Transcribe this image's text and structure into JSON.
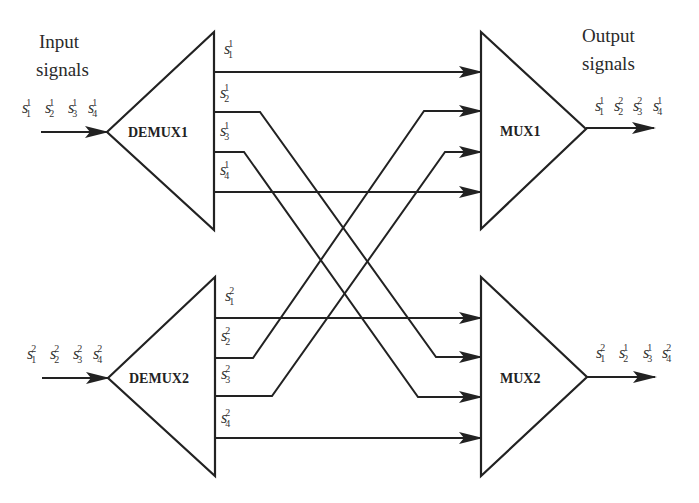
{
  "diagram": {
    "type": "WDM demultiplexer/multiplexer cross-connect",
    "input_title": [
      "Input",
      "signals"
    ],
    "output_title": [
      "Output",
      "signals"
    ],
    "blocks": {
      "demux1": "DEMUX1",
      "demux2": "DEMUX2",
      "mux1": "MUX1",
      "mux2": "MUX2"
    },
    "inputs": {
      "demux1": [
        {
          "base": "s",
          "sub": "1",
          "sup": "1"
        },
        {
          "base": "s",
          "sub": "2",
          "sup": "1"
        },
        {
          "base": "s",
          "sub": "3",
          "sup": "1"
        },
        {
          "base": "s",
          "sub": "4",
          "sup": "1"
        }
      ],
      "demux2": [
        {
          "base": "s",
          "sub": "1",
          "sup": "2"
        },
        {
          "base": "s",
          "sub": "2",
          "sup": "2"
        },
        {
          "base": "s",
          "sub": "3",
          "sup": "2"
        },
        {
          "base": "s",
          "sub": "4",
          "sup": "2"
        }
      ]
    },
    "demux1_ports": [
      {
        "base": "s",
        "sub": "1",
        "sup": "1"
      },
      {
        "base": "s",
        "sub": "2",
        "sup": "1"
      },
      {
        "base": "s",
        "sub": "3",
        "sup": "1"
      },
      {
        "base": "s",
        "sub": "4",
        "sup": "1"
      }
    ],
    "demux2_ports": [
      {
        "base": "s",
        "sub": "1",
        "sup": "2"
      },
      {
        "base": "s",
        "sub": "2",
        "sup": "2"
      },
      {
        "base": "s",
        "sub": "3",
        "sup": "2"
      },
      {
        "base": "s",
        "sub": "4",
        "sup": "2"
      }
    ],
    "outputs": {
      "mux1": [
        {
          "base": "s",
          "sub": "1",
          "sup": "1"
        },
        {
          "base": "s",
          "sub": "2",
          "sup": "2"
        },
        {
          "base": "s",
          "sub": "3",
          "sup": "2"
        },
        {
          "base": "s",
          "sub": "4",
          "sup": "1"
        }
      ],
      "mux2": [
        {
          "base": "s",
          "sub": "1",
          "sup": "2"
        },
        {
          "base": "s",
          "sub": "2",
          "sup": "1"
        },
        {
          "base": "s",
          "sub": "3",
          "sup": "1"
        },
        {
          "base": "s",
          "sub": "4",
          "sup": "2"
        }
      ]
    },
    "connections": [
      {
        "from": "DEMUX1 s1^1",
        "to": "MUX1 port 1"
      },
      {
        "from": "DEMUX1 s2^1",
        "to": "MUX2 port 2"
      },
      {
        "from": "DEMUX1 s3^1",
        "to": "MUX2 port 3"
      },
      {
        "from": "DEMUX1 s4^1",
        "to": "MUX1 port 4"
      },
      {
        "from": "DEMUX2 s1^2",
        "to": "MUX2 port 1"
      },
      {
        "from": "DEMUX2 s2^2",
        "to": "MUX1 port 2"
      },
      {
        "from": "DEMUX2 s3^2",
        "to": "MUX1 port 3"
      },
      {
        "from": "DEMUX2 s4^2",
        "to": "MUX2 port 4"
      }
    ],
    "colors": {
      "stroke": "#222222",
      "text": "#2a2a2a",
      "background": "#ffffff"
    }
  }
}
